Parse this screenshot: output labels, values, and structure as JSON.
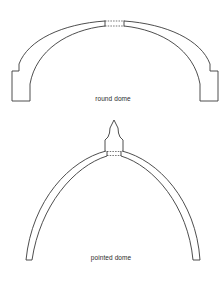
{
  "figure": {
    "background": "#ffffff",
    "line_color": "#3a3a3a",
    "diagrams": [
      {
        "id": "round",
        "label": "round dome",
        "label_pos": {
          "x": 113,
          "y": 96
        }
      },
      {
        "id": "pointed",
        "label": "pointed dome",
        "label_pos": {
          "x": 111,
          "y": 255
        }
      }
    ]
  }
}
